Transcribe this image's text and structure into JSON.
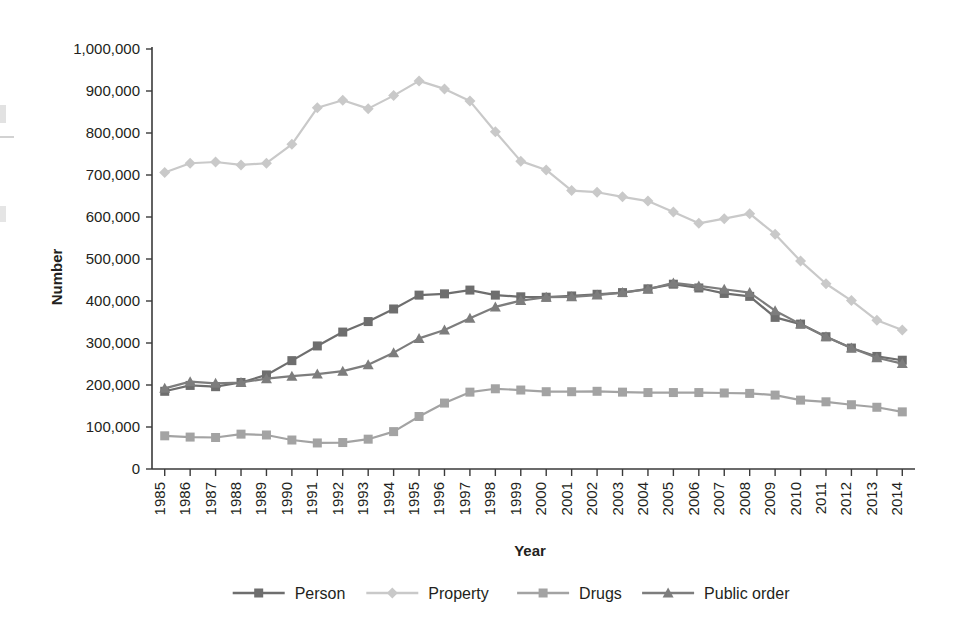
{
  "chart_data": {
    "type": "line",
    "title": "",
    "xlabel": "Year",
    "ylabel": "Number",
    "ylim": [
      0,
      1000000
    ],
    "ytick_step": 100000,
    "grid": false,
    "legend_position": "bottom",
    "ytick_labels": [
      "0",
      "100,000",
      "200,000",
      "300,000",
      "400,000",
      "500,000",
      "600,000",
      "700,000",
      "800,000",
      "900,000",
      "1,000,000"
    ],
    "ytick_values": [
      0,
      100000,
      200000,
      300000,
      400000,
      500000,
      600000,
      700000,
      800000,
      900000,
      1000000
    ],
    "categories": [
      "1985",
      "1986",
      "1987",
      "1988",
      "1989",
      "1990",
      "1991",
      "1992",
      "1993",
      "1994",
      "1995",
      "1996",
      "1997",
      "1998",
      "1999",
      "2000",
      "2001",
      "2002",
      "2003",
      "2004",
      "2005",
      "2006",
      "2007",
      "2008",
      "2009",
      "2010",
      "2011",
      "2012",
      "2013",
      "2014"
    ],
    "series": [
      {
        "name": "Person",
        "color": "#6e6e6e",
        "marker": "square",
        "values": [
          185000,
          199000,
          196000,
          206000,
          224000,
          258000,
          293000,
          326000,
          351000,
          381000,
          414000,
          417000,
          426000,
          414000,
          410000,
          409000,
          412000,
          416000,
          420000,
          429000,
          440000,
          431000,
          418000,
          411000,
          361000,
          345000,
          315000,
          288000,
          268000,
          259000
        ]
      },
      {
        "name": "Property",
        "color": "#c9c9c9",
        "marker": "diamond",
        "values": [
          706000,
          728000,
          731000,
          724000,
          728000,
          773000,
          860000,
          878000,
          858000,
          889000,
          924000,
          905000,
          876000,
          803000,
          733000,
          712000,
          663000,
          659000,
          648000,
          638000,
          612000,
          585000,
          596000,
          608000,
          559000,
          495000,
          441000,
          401000,
          354000,
          331000
        ]
      },
      {
        "name": "Drugs",
        "color": "#a3a3a3",
        "marker": "square",
        "values": [
          79000,
          76000,
          75000,
          83000,
          81000,
          69000,
          62000,
          63000,
          71000,
          89000,
          125000,
          157000,
          183000,
          191000,
          188000,
          184000,
          184000,
          185000,
          183000,
          182000,
          182000,
          182000,
          181000,
          180000,
          176000,
          164000,
          160000,
          153000,
          147000,
          136000
        ]
      },
      {
        "name": "Public order",
        "color": "#7d7d7d",
        "marker": "triangle",
        "values": [
          192000,
          208000,
          204000,
          206000,
          215000,
          221000,
          226000,
          233000,
          248000,
          277000,
          311000,
          331000,
          359000,
          386000,
          401000,
          409000,
          410000,
          414000,
          420000,
          428000,
          443000,
          436000,
          428000,
          420000,
          377000,
          345000,
          315000,
          288000,
          265000,
          251000
        ]
      }
    ]
  },
  "legend": {
    "items": [
      {
        "label": "Person"
      },
      {
        "label": "Property"
      },
      {
        "label": "Drugs"
      },
      {
        "label": "Public order"
      }
    ]
  }
}
